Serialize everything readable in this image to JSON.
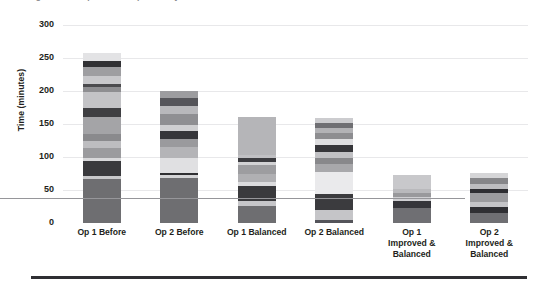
{
  "clipped_title": "Figure — Comparison of operator cycle times",
  "axes": {
    "y_title": "Time (minutes)",
    "y_ticks": [
      0,
      50,
      100,
      150,
      200,
      250,
      300
    ],
    "x_labels": [
      [
        "Op 1 Before"
      ],
      [
        "Op 2 Before"
      ],
      [
        "Op 1 Balanced"
      ],
      [
        "Op 2 Balanced"
      ],
      [
        "Op 1",
        "Improved &",
        "Balanced"
      ],
      [
        "Op 2",
        "Improved &",
        "Balanced"
      ]
    ]
  },
  "chart_data": {
    "type": "bar",
    "subtype": "stacked-bar",
    "title": "",
    "xlabel": "",
    "ylabel": "Time (minutes)",
    "ylim": [
      0,
      300
    ],
    "ytick_interval": 50,
    "grid": true,
    "legend": "none",
    "categories": [
      "Op 1 Before",
      "Op 2 Before",
      "Op 1 Balanced",
      "Op 2 Balanced",
      "Op 1 Improved & Balanced",
      "Op 2 Improved & Balanced"
    ],
    "totals": [
      258,
      200,
      161,
      160,
      73,
      76
    ],
    "stacks": [
      {
        "category": "Op 1 Before",
        "total": 258,
        "segments": [
          {
            "value": 66,
            "color": "#6e6e71"
          },
          {
            "value": 6,
            "color": "#c9c9cb"
          },
          {
            "value": 22,
            "color": "#3a3a3d"
          },
          {
            "value": 5,
            "color": "#d8d8da"
          },
          {
            "value": 15,
            "color": "#9b9b9e"
          },
          {
            "value": 11,
            "color": "#bdbdc0"
          },
          {
            "value": 10,
            "color": "#8a8a8d"
          },
          {
            "value": 25,
            "color": "#a4a4a7"
          },
          {
            "value": 14,
            "color": "#3f3f42"
          },
          {
            "value": 25,
            "color": "#c3c3c6"
          },
          {
            "value": 7,
            "color": "#8e8e91"
          },
          {
            "value": 4,
            "color": "#4b4b4e"
          },
          {
            "value": 13,
            "color": "#c8c8cb"
          },
          {
            "value": 13,
            "color": "#9e9ea1"
          },
          {
            "value": 9,
            "color": "#313134"
          },
          {
            "value": 13,
            "color": "#e3e3e5"
          }
        ]
      },
      {
        "category": "Op 2 Before",
        "total": 200,
        "segments": [
          {
            "value": 68,
            "color": "#6e6e71"
          },
          {
            "value": 5,
            "color": "#d4d4d6"
          },
          {
            "value": 3,
            "color": "#2f2f32"
          },
          {
            "value": 23,
            "color": "#e0e0e2"
          },
          {
            "value": 16,
            "color": "#b4b4b7"
          },
          {
            "value": 13,
            "color": "#9a9a9d"
          },
          {
            "value": 12,
            "color": "#36363a"
          },
          {
            "value": 9,
            "color": "#cfcfd1"
          },
          {
            "value": 16,
            "color": "#8f8f92"
          },
          {
            "value": 12,
            "color": "#b8b8bb"
          },
          {
            "value": 12,
            "color": "#55555a"
          },
          {
            "value": 11,
            "color": "#9c9c9f"
          }
        ]
      },
      {
        "category": "Op 1 Balanced",
        "total": 161,
        "segments": [
          {
            "value": 26,
            "color": "#6e6e71"
          },
          {
            "value": 7,
            "color": "#c6c6c9"
          },
          {
            "value": 23,
            "color": "#3a3a3d"
          },
          {
            "value": 6,
            "color": "#dcdcde"
          },
          {
            "value": 13,
            "color": "#b0b0b3"
          },
          {
            "value": 13,
            "color": "#9d9da0"
          },
          {
            "value": 5,
            "color": "#d2d2d4"
          },
          {
            "value": 5,
            "color": "#3c3c40"
          },
          {
            "value": 5,
            "color": "#c0c0c3"
          },
          {
            "value": 58,
            "color": "#b5b5b8"
          }
        ]
      },
      {
        "category": "Op 2 Balanced",
        "total": 160,
        "segments": [
          {
            "value": 4,
            "color": "#54545a"
          },
          {
            "value": 16,
            "color": "#c5c5c8"
          },
          {
            "value": 24,
            "color": "#3b3b3e"
          },
          {
            "value": 34,
            "color": "#eaeaec"
          },
          {
            "value": 12,
            "color": "#a8a8ab"
          },
          {
            "value": 8,
            "color": "#88888b"
          },
          {
            "value": 10,
            "color": "#c1c1c4"
          },
          {
            "value": 11,
            "color": "#36363a"
          },
          {
            "value": 8,
            "color": "#dedee0"
          },
          {
            "value": 9,
            "color": "#8d8d90"
          },
          {
            "value": 8,
            "color": "#b2b2b5"
          },
          {
            "value": 8,
            "color": "#6f6f73"
          },
          {
            "value": 8,
            "color": "#cccccf"
          }
        ]
      },
      {
        "category": "Op 1 Improved & Balanced",
        "total": 73,
        "segments": [
          {
            "value": 23,
            "color": "#6f6f73"
          },
          {
            "value": 10,
            "color": "#35353a"
          },
          {
            "value": 6,
            "color": "#cfcfd2"
          },
          {
            "value": 7,
            "color": "#99999c"
          },
          {
            "value": 5,
            "color": "#b9b9bc"
          },
          {
            "value": 22,
            "color": "#c8c8cb"
          }
        ]
      },
      {
        "category": "Op 2 Improved & Balanced",
        "total": 76,
        "segments": [
          {
            "value": 15,
            "color": "#6f6f73"
          },
          {
            "value": 9,
            "color": "#2f2f33"
          },
          {
            "value": 8,
            "color": "#c4c4c7"
          },
          {
            "value": 14,
            "color": "#9b9b9e"
          },
          {
            "value": 6,
            "color": "#2e2e32"
          },
          {
            "value": 7,
            "color": "#bdbdc0"
          },
          {
            "value": 9,
            "color": "#868689"
          },
          {
            "value": 8,
            "color": "#d5d5d7"
          }
        ]
      }
    ]
  }
}
